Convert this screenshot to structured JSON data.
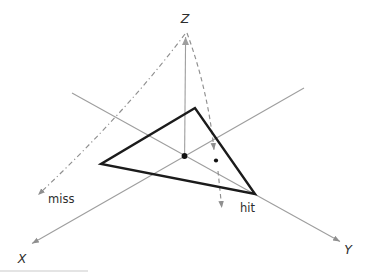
{
  "diagram": {
    "kind": "ray-triangle-intersection-3d",
    "background": "#ffffff",
    "axes": {
      "x": {
        "label": "X"
      },
      "y": {
        "label": "Y"
      },
      "z": {
        "label": "Z"
      }
    },
    "rays": [
      {
        "id": "miss",
        "label": "miss",
        "style": "dash-dot"
      },
      {
        "id": "hit",
        "label": "hit",
        "style": "dashed"
      }
    ],
    "geometry": {
      "ray_origin_px": [
        186,
        33
      ],
      "triangle_vertices_px": [
        [
          195,
          108
        ],
        [
          101,
          164
        ],
        [
          255,
          194
        ]
      ],
      "origin_point_px": [
        184,
        156
      ],
      "hit_intersection_point_px": [
        216,
        160
      ]
    },
    "colors": {
      "background": "#ffffff",
      "axis": "#9e9e9e",
      "ray": "#8f8f8f",
      "triangle": "#1b1b1b",
      "point": "#111111",
      "label": "#2d2d2d"
    }
  }
}
